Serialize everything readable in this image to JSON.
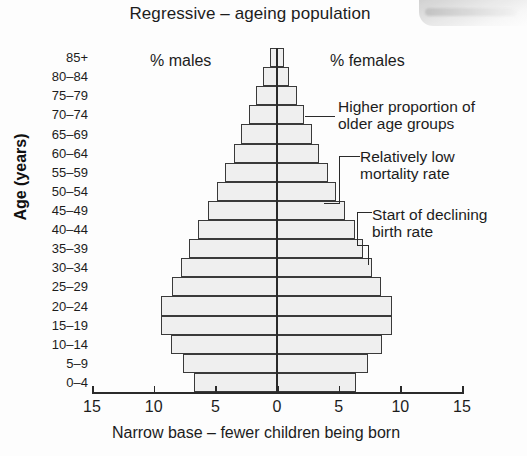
{
  "chart_title": "Regressive – ageing population",
  "axes": {
    "y_caption": "Age (years)",
    "x_caption": "Narrow base – fewer children being born",
    "x_ticks": [
      "15",
      "10",
      "5",
      "0",
      "5",
      "10",
      "15"
    ]
  },
  "series_labels": {
    "males": "% males",
    "females": "% females"
  },
  "annotations": [
    {
      "text": "Higher proportion of\nolder age groups"
    },
    {
      "text": "Relatively low\nmortality rate"
    },
    {
      "text": "Start of declining\nbirth rate"
    }
  ],
  "colors": {
    "bar_fill": "#efefef",
    "bar_stroke": "#3a3a3a",
    "axis": "#2a2a2a",
    "text": "#1c1c1c",
    "background": "#fdfdfd"
  },
  "chart_data": {
    "type": "bar",
    "title": "Regressive – ageing population",
    "subtitle": "Narrow base – fewer children being born",
    "xlabel": "Narrow base – fewer children being born",
    "ylabel": "Age (years)",
    "orientation": "population-pyramid",
    "xlim": [
      -15,
      15
    ],
    "xticks": [
      15,
      10,
      5,
      0,
      5,
      10,
      15
    ],
    "grid": false,
    "legend_position": "top-inside",
    "categories": [
      "0–4",
      "5–9",
      "10–14",
      "15–19",
      "20–24",
      "25–29",
      "30–34",
      "35–39",
      "40–44",
      "45–49",
      "50–54",
      "55–59",
      "60–64",
      "65–69",
      "70–74",
      "75–79",
      "80–84",
      "85+"
    ],
    "series": [
      {
        "name": "% males",
        "side": "left",
        "values": [
          6.7,
          7.6,
          8.6,
          9.4,
          9.4,
          8.5,
          7.8,
          7.1,
          6.4,
          5.6,
          4.9,
          4.2,
          3.5,
          2.9,
          2.3,
          1.7,
          1.1,
          0.6
        ]
      },
      {
        "name": "% females",
        "side": "right",
        "values": [
          6.4,
          7.4,
          8.5,
          9.3,
          9.3,
          8.4,
          7.7,
          7.0,
          6.3,
          5.5,
          4.8,
          4.1,
          3.4,
          2.8,
          2.2,
          1.6,
          1.0,
          0.6
        ]
      }
    ],
    "annotations": [
      {
        "label": "Higher proportion of older age groups",
        "points_to": "75–79"
      },
      {
        "label": "Relatively low mortality rate",
        "points_to": "50–54"
      },
      {
        "label": "Start of declining birth rate",
        "points_to": "40–44"
      }
    ]
  }
}
